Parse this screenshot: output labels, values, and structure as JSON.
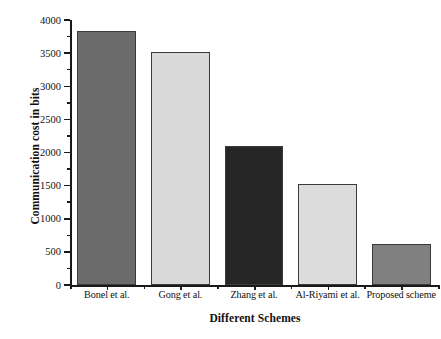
{
  "chart_data": {
    "type": "bar",
    "title": "",
    "xlabel": "Different Schemes",
    "ylabel": "Communication cost in bits",
    "categories": [
      "Bonel et al.",
      "Gong et al.",
      "Zhang et al.",
      "Al-Riyami et al.",
      "Proposed scheme"
    ],
    "values": [
      3840,
      3520,
      2100,
      1520,
      620
    ],
    "bar_colors": [
      "#6b6b6b",
      "#d9d9d9",
      "#262626",
      "#dcdcdc",
      "#808080"
    ],
    "bar_border_color": "#3a3a3a",
    "ylim": [
      0,
      4000
    ],
    "ytick_labels": [
      "0",
      "500",
      "1000",
      "1500",
      "2000",
      "2500",
      "3000",
      "3500",
      "4000"
    ],
    "ytick_values": [
      0,
      500,
      1000,
      1500,
      2000,
      2500,
      3000,
      3500,
      4000
    ],
    "yminor_values": [
      250,
      750,
      1250,
      1750,
      2250,
      2750,
      3250,
      3750
    ],
    "grid": false,
    "legend": false,
    "legend_position": "none",
    "series": [
      {
        "name": "Communication cost in bits",
        "values": [
          3840,
          3520,
          2100,
          1520,
          620
        ]
      }
    ]
  },
  "axes": {
    "y_title": "Communication cost in bits",
    "x_title": "Different Schemes"
  }
}
